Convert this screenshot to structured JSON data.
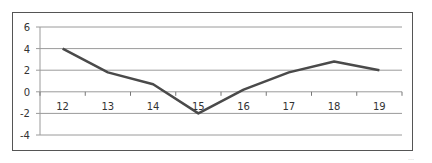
{
  "chart_data": {
    "type": "line",
    "title": "",
    "xlabel": "",
    "ylabel": "",
    "categories": [
      "12",
      "13",
      "14",
      "15",
      "16",
      "17",
      "18",
      "19"
    ],
    "series": [
      {
        "name": "Series 1",
        "values": [
          4.0,
          1.8,
          0.7,
          -2.0,
          0.2,
          1.8,
          2.8,
          2.0
        ],
        "color": "#4a4a4a"
      }
    ],
    "yticks": [
      "6",
      "4",
      "2",
      "0",
      "-2",
      "-4"
    ],
    "ylim": [
      -4,
      6
    ],
    "grid": true,
    "legend": "none",
    "x_axis_at": 0
  },
  "caption": "…"
}
